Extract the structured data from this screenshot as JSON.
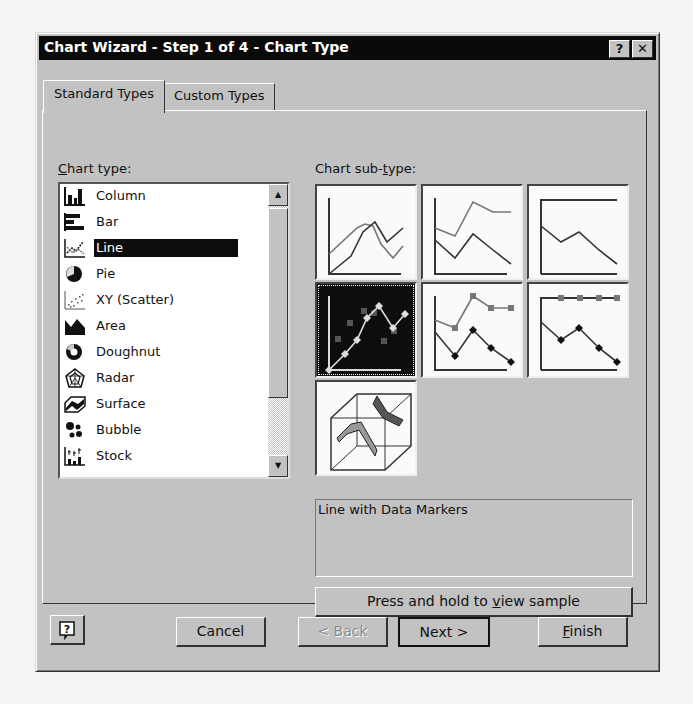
{
  "dialog": {
    "title": "Chart Wizard - Step 1 of 4 - Chart Type",
    "title_buttons": {
      "help": "?",
      "close": "✕"
    }
  },
  "tabs": [
    {
      "label": "Standard Types",
      "active": true
    },
    {
      "label": "Custom Types",
      "active": false
    }
  ],
  "chart_type": {
    "label_hotkey": "C",
    "label_rest": "hart type:",
    "selected": "Line",
    "items": [
      {
        "label": "Column",
        "icon": "column-chart-icon"
      },
      {
        "label": "Bar",
        "icon": "bar-chart-icon"
      },
      {
        "label": "Line",
        "icon": "line-chart-icon"
      },
      {
        "label": "Pie",
        "icon": "pie-chart-icon"
      },
      {
        "label": "XY (Scatter)",
        "icon": "scatter-chart-icon"
      },
      {
        "label": "Area",
        "icon": "area-chart-icon"
      },
      {
        "label": "Doughnut",
        "icon": "doughnut-chart-icon"
      },
      {
        "label": "Radar",
        "icon": "radar-chart-icon"
      },
      {
        "label": "Surface",
        "icon": "surface-chart-icon"
      },
      {
        "label": "Bubble",
        "icon": "bubble-chart-icon"
      },
      {
        "label": "Stock",
        "icon": "stock-chart-icon"
      }
    ],
    "scroll_up": "▲",
    "scroll_down": "▼"
  },
  "sub_type": {
    "label_pre": "Chart sub-",
    "label_hotkey": "t",
    "label_post": "ype:",
    "selected_index": 3,
    "items": [
      "line-icon",
      "stacked-line-icon",
      "100-percent-stacked-line-icon",
      "line-with-markers-icon",
      "stacked-line-with-markers-icon",
      "100-percent-stacked-line-with-markers-icon",
      "3d-line-icon"
    ],
    "description": "Line with Data Markers"
  },
  "sample_button": {
    "pre": "Press and hold to ",
    "hotkey": "v",
    "post": "iew sample"
  },
  "footer": {
    "help": "?",
    "cancel": "Cancel",
    "back": "< Back",
    "next": "Next >",
    "finish_hotkey": "F",
    "finish_rest": "inish"
  }
}
